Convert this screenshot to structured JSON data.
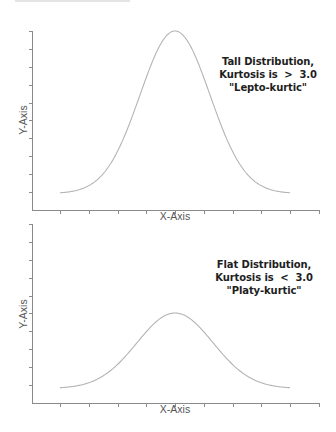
{
  "chart_data": [
    {
      "type": "line",
      "title": "",
      "xlabel": "X-Axis",
      "ylabel": "Y-Axis",
      "annotation": [
        "Tall Distribution,",
        "Kurtosis is  >  3.0",
        "\"Lepto-kurtic\""
      ],
      "grid": false,
      "x_tick_count": 10,
      "y_tick_count": 10,
      "series": [
        {
          "name": "Tall distribution (leptokurtic)",
          "shape": "bell",
          "x": [
            -4,
            -3,
            -2,
            -1,
            0,
            1,
            2,
            3,
            4
          ],
          "values": [
            0.0,
            0.05,
            0.23,
            0.7,
            1.0,
            0.7,
            0.23,
            0.05,
            0.0
          ],
          "relative_peak_height": 0.92
        }
      ],
      "ylim": [
        0,
        1
      ]
    },
    {
      "type": "line",
      "title": "",
      "xlabel": "X-Axis",
      "ylabel": "Y-Axis",
      "annotation": [
        "Flat Distribution,",
        "Kurtosis is  <  3.0",
        "\"Platy-kurtic\""
      ],
      "grid": false,
      "x_tick_count": 10,
      "y_tick_count": 10,
      "series": [
        {
          "name": "Flat distribution (platykurtic)",
          "shape": "bell",
          "x": [
            -4,
            -3,
            -2,
            -1,
            0,
            1,
            2,
            3,
            4
          ],
          "values": [
            0.0,
            0.03,
            0.11,
            0.32,
            0.46,
            0.32,
            0.11,
            0.03,
            0.0
          ],
          "relative_peak_height": 0.45
        }
      ],
      "ylim": [
        0,
        1
      ]
    }
  ],
  "top_chart": {
    "xlabel": "X-Axis",
    "ylabel": "Y-Axis",
    "annotation_line1": "Tall Distribution,",
    "annotation_line2": "Kurtosis is  >  3.0",
    "annotation_line3": "\"Lepto-kurtic\""
  },
  "bottom_chart": {
    "xlabel": "X-Axis",
    "ylabel": "Y-Axis",
    "annotation_line1": "Flat Distribution,",
    "annotation_line2": "Kurtosis is  <  3.0",
    "annotation_line3": "\"Platy-kurtic\""
  },
  "colors": {
    "axis": "#8a8a8a",
    "curve": "#b4b4b4",
    "annotation_text": "#1e1e1e",
    "background": "#ffffff"
  }
}
